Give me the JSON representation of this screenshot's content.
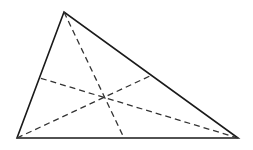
{
  "diagram": {
    "type": "triangle-medians",
    "width": 253,
    "height": 150,
    "colors": {
      "background": "#ffffff",
      "stroke": "#1a1a1a",
      "dash": "#333333"
    },
    "vertices": {
      "top": {
        "x": 64,
        "y": 12
      },
      "bottom_left": {
        "x": 17,
        "y": 138
      },
      "bottom_right": {
        "x": 238,
        "y": 138
      }
    },
    "side_points": {
      "left_side": {
        "x": 40,
        "y": 78
      },
      "right_side": {
        "x": 152,
        "y": 75
      },
      "base": {
        "x": 124,
        "y": 138
      }
    },
    "intersection": {
      "x": 105,
      "y": 97
    }
  }
}
